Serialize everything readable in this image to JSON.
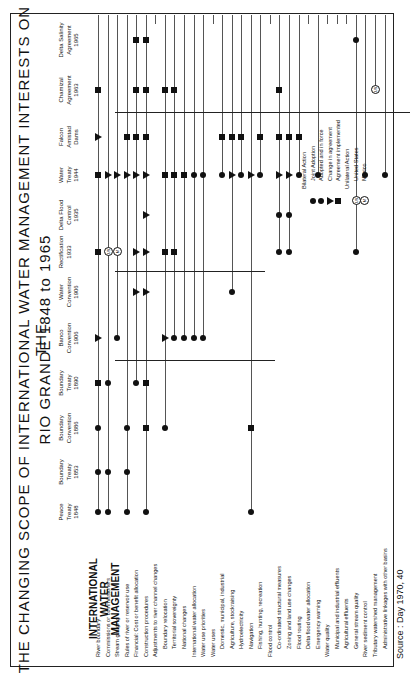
{
  "title": {
    "line1": "THE  CHANGING  SCOPE  OF  INTERNATIONAL  WATER  MANAGEMENT  INTERESTS  ON  THE",
    "line2": "RIO  GRANDE   1848  to  1965"
  },
  "row_header": {
    "line1": "INTERNATIONAL WATER",
    "line2": "MANAGEMENT"
  },
  "columns": [
    {
      "name": "Peace",
      "sub": "Treaty",
      "year": "1848"
    },
    {
      "name": "Boundary",
      "sub": "Treaty",
      "year": "1853"
    },
    {
      "name": "Boundary",
      "sub": "Convention",
      "year": "1886"
    },
    {
      "name": "Boundary",
      "sub": "Treaty",
      "year": "1890"
    },
    {
      "name": "Banco",
      "sub": "Convention",
      "year": "1906"
    },
    {
      "name": "Water",
      "sub": "Convention",
      "year": "1906"
    },
    {
      "name": "Rectification",
      "sub": "",
      "year": "1933"
    },
    {
      "name": "Delta Flood",
      "sub": "Control",
      "year": "1935"
    },
    {
      "name": "Water",
      "sub": "Treaty",
      "year": "1944"
    },
    {
      "name": "Falcon",
      "sub": "Amistad",
      "year": "Dams"
    },
    {
      "name": "Chamizal",
      "sub": "Agreement",
      "year": "1963"
    },
    {
      "name": "Delta Salinity",
      "sub": "Agreement",
      "year": "1965"
    }
  ],
  "rows": [
    {
      "label": "River boundary",
      "indent": false
    },
    {
      "label": "Commissions or commissioners",
      "indent": false
    },
    {
      "label": "Stream gauging",
      "indent": false
    },
    {
      "label": "Rules of river or reservoir use",
      "indent": false
    },
    {
      "label": "Financial: Cost or benefit allocation",
      "indent": false
    },
    {
      "label": "Construction procedures",
      "indent": false
    },
    {
      "label": "Adjustments to river channel changes",
      "indent": false
    },
    {
      "label": "Boundary relocation",
      "indent": true
    },
    {
      "label": "Territorial sovereignty",
      "indent": true
    },
    {
      "label": "National changes",
      "indent": true
    },
    {
      "label": "International water allocation",
      "indent": false
    },
    {
      "label": "Water use priorities",
      "indent": false
    },
    {
      "label": "Water uses",
      "indent": false
    },
    {
      "label": "Domestic, municipal, industrial",
      "indent": true
    },
    {
      "label": "Agriculture, stockraising",
      "indent": true
    },
    {
      "label": "Hydroelectricity",
      "indent": true
    },
    {
      "label": "Navigation",
      "indent": true
    },
    {
      "label": "Fishing, hunting, recreation",
      "indent": true
    },
    {
      "label": "Flood control",
      "indent": false
    },
    {
      "label": "Co-ordinated structural measures",
      "indent": true
    },
    {
      "label": "Zoning and land use changes",
      "indent": true
    },
    {
      "label": "Flood routing",
      "indent": true
    },
    {
      "label": "Delta flood water allocation",
      "indent": true
    },
    {
      "label": "Emergency warning",
      "indent": true
    },
    {
      "label": "Water quality",
      "indent": false
    },
    {
      "label": "Municipal and industrial effluents",
      "indent": true
    },
    {
      "label": "Agricultural effluents",
      "indent": true
    },
    {
      "label": "General stream quality",
      "indent": true
    },
    {
      "label": "River sediment control",
      "indent": false
    },
    {
      "label": "Tributary watershed management",
      "indent": false
    },
    {
      "label": "Administrative linkages with other basins",
      "indent": true
    }
  ],
  "chart_data": {
    "type": "table",
    "title": "THE CHANGING SCOPE OF INTERNATIONAL WATER MANAGEMENT INTERESTS ON THE RIO GRANDE 1848 to 1965",
    "columns": [
      "Peace Treaty 1848",
      "Boundary Treaty 1853",
      "Boundary Convention 1886",
      "Boundary Treaty 1890",
      "Banco Convention 1906",
      "Water Convention 1906",
      "Rectification 1933",
      "Delta Flood Control 1935",
      "Water Treaty 1944",
      "Falcon Amistad Dams",
      "Chamizal Agreement 1963",
      "Delta Salinity Agreement 1965"
    ],
    "marker_legend": {
      "dot": "Joint Adoption",
      "dot_stem": "Adopted and in force",
      "triangle": "Change in agreement",
      "square": "Agreement implemented",
      "US": "United States (unilateral)",
      "M": "Mexico (unilateral)"
    },
    "marks": [
      {
        "row": 0,
        "col": 0,
        "m": "dot"
      },
      {
        "row": 0,
        "col": 1,
        "m": "dot"
      },
      {
        "row": 0,
        "col": 2,
        "m": "dot"
      },
      {
        "row": 0,
        "col": 3,
        "m": "sq"
      },
      {
        "row": 0,
        "col": 4,
        "m": "tri"
      },
      {
        "row": 0,
        "col": 6,
        "m": "sq"
      },
      {
        "row": 0,
        "col": 8,
        "m": "sq"
      },
      {
        "row": 0,
        "col": 9,
        "m": "tri"
      },
      {
        "row": 0,
        "col": 10,
        "m": "sq"
      },
      {
        "row": 1,
        "col": 0,
        "m": "dot"
      },
      {
        "row": 1,
        "col": 1,
        "m": "dot"
      },
      {
        "row": 1,
        "col": 3,
        "m": "dot"
      },
      {
        "row": 1,
        "col": 6,
        "m": "us"
      },
      {
        "row": 1,
        "col": 8,
        "m": "tri"
      },
      {
        "row": 2,
        "col": 4,
        "m": "dot"
      },
      {
        "row": 2,
        "col": 6,
        "m": "mx"
      },
      {
        "row": 2,
        "col": 8,
        "m": "tri"
      },
      {
        "row": 3,
        "col": 0,
        "m": "dot"
      },
      {
        "row": 3,
        "col": 1,
        "m": "dot"
      },
      {
        "row": 3,
        "col": 2,
        "m": "dot"
      },
      {
        "row": 3,
        "col": 8,
        "m": "tri"
      },
      {
        "row": 3,
        "col": 9,
        "m": "sq"
      },
      {
        "row": 4,
        "col": 3,
        "m": "dot"
      },
      {
        "row": 4,
        "col": 5,
        "m": "tri"
      },
      {
        "row": 4,
        "col": 6,
        "m": "tri"
      },
      {
        "row": 4,
        "col": 8,
        "m": "tri"
      },
      {
        "row": 4,
        "col": 9,
        "m": "sq"
      },
      {
        "row": 4,
        "col": 10,
        "m": "sq"
      },
      {
        "row": 4,
        "col": 11,
        "m": "sq"
      },
      {
        "row": 5,
        "col": 0,
        "m": "dot"
      },
      {
        "row": 5,
        "col": 2,
        "m": "sq"
      },
      {
        "row": 5,
        "col": 3,
        "m": "sq"
      },
      {
        "row": 5,
        "col": 5,
        "m": "tri"
      },
      {
        "row": 5,
        "col": 6,
        "m": "tri"
      },
      {
        "row": 5,
        "col": 7,
        "m": "tri"
      },
      {
        "row": 5,
        "col": 8,
        "m": "tri"
      },
      {
        "row": 5,
        "col": 9,
        "m": "sq"
      },
      {
        "row": 5,
        "col": 10,
        "m": "sq"
      },
      {
        "row": 5,
        "col": 11,
        "m": "sq"
      },
      {
        "row": 7,
        "col": 2,
        "m": "dot"
      },
      {
        "row": 7,
        "col": 4,
        "m": "tri"
      },
      {
        "row": 7,
        "col": 6,
        "m": "sq"
      },
      {
        "row": 7,
        "col": 8,
        "m": "sq"
      },
      {
        "row": 7,
        "col": 10,
        "m": "sq"
      },
      {
        "row": 8,
        "col": 4,
        "m": "dot"
      },
      {
        "row": 8,
        "col": 6,
        "m": "sq"
      },
      {
        "row": 8,
        "col": 8,
        "m": "sq"
      },
      {
        "row": 8,
        "col": 10,
        "m": "sq"
      },
      {
        "row": 9,
        "col": 4,
        "m": "dot"
      },
      {
        "row": 9,
        "col": 8,
        "m": "sq"
      },
      {
        "row": 10,
        "col": 4,
        "m": "dot"
      },
      {
        "row": 10,
        "col": 8,
        "m": "dot"
      },
      {
        "row": 11,
        "col": 4,
        "m": "dot"
      },
      {
        "row": 11,
        "col": 8,
        "m": "dot"
      },
      {
        "row": 13,
        "col": 8,
        "m": "dot"
      },
      {
        "row": 13,
        "col": 9,
        "m": "sq"
      },
      {
        "row": 14,
        "col": 5,
        "m": "dot"
      },
      {
        "row": 14,
        "col": 8,
        "m": "tri"
      },
      {
        "row": 14,
        "col": 9,
        "m": "sq"
      },
      {
        "row": 15,
        "col": 8,
        "m": "dot"
      },
      {
        "row": 15,
        "col": 9,
        "m": "sq"
      },
      {
        "row": 16,
        "col": 0,
        "m": "dot"
      },
      {
        "row": 16,
        "col": 2,
        "m": "sq"
      },
      {
        "row": 16,
        "col": 8,
        "m": "tri"
      },
      {
        "row": 17,
        "col": 8,
        "m": "dot"
      },
      {
        "row": 17,
        "col": 9,
        "m": "sq"
      },
      {
        "row": 19,
        "col": 6,
        "m": "dot"
      },
      {
        "row": 19,
        "col": 7,
        "m": "dot"
      },
      {
        "row": 19,
        "col": 8,
        "m": "tri"
      },
      {
        "row": 19,
        "col": 9,
        "m": "sq"
      },
      {
        "row": 19,
        "col": 10,
        "m": "sq"
      },
      {
        "row": 20,
        "col": 6,
        "m": "dot"
      },
      {
        "row": 20,
        "col": 7,
        "m": "dot"
      },
      {
        "row": 20,
        "col": 8,
        "m": "tri"
      },
      {
        "row": 20,
        "col": 9,
        "m": "sq"
      },
      {
        "row": 21,
        "col": 8,
        "m": "dot"
      },
      {
        "row": 21,
        "col": 9,
        "m": "sq"
      },
      {
        "row": 23,
        "col": 8,
        "m": "dot"
      },
      {
        "row": 27,
        "col": 6,
        "m": "dot"
      },
      {
        "row": 27,
        "col": 11,
        "m": "dot"
      },
      {
        "row": 28,
        "col": 8,
        "m": "dot"
      },
      {
        "row": 29,
        "col": 10,
        "m": "us"
      },
      {
        "row": 30,
        "col": 8,
        "m": "dot"
      }
    ]
  },
  "legend": {
    "bilateral": "Bilateral Action",
    "joint": "Joint Adoption",
    "adopted": "Adopted and in force",
    "change": "Change in agreement",
    "implemented": "Agreement implemented",
    "unilateral": "Unilateral Action",
    "us": "United States",
    "mexico": "Mexico",
    "us_glyph": "US",
    "mx_glyph": "M"
  },
  "source": "Source :  Day 1970, 40"
}
